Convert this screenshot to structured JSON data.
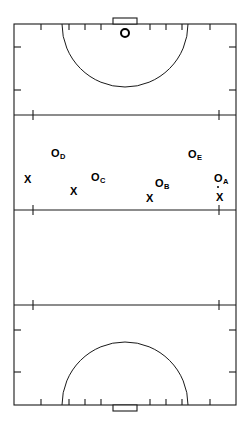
{
  "diagram": {
    "sport": "field-hockey",
    "colors": {
      "line": "#1a1a1a",
      "marker": "#000000",
      "background": "#ffffff"
    },
    "field": {
      "left": 14,
      "right": 236,
      "top": 24,
      "bottom": 405,
      "line_width": 1.1
    },
    "horizontal_lines": [
      {
        "name": "back-line-top",
        "y": 24
      },
      {
        "name": "twenty-five-yard-line-top",
        "y": 115
      },
      {
        "name": "halfway-line",
        "y": 210
      },
      {
        "name": "twenty-five-yard-line-bottom",
        "y": 305
      },
      {
        "name": "back-line-bottom",
        "y": 405
      }
    ],
    "side_tick_y": [
      47,
      90,
      115,
      210,
      305,
      330,
      372
    ],
    "top_line_ticks_x": [
      41,
      69,
      85,
      101,
      150,
      166,
      182,
      210
    ],
    "bottom_line_ticks_x": [
      41,
      69,
      85,
      101,
      150,
      166,
      182,
      210
    ],
    "shooting_circles": [
      {
        "name": "shooting-circle-top",
        "cx": 125,
        "cy": 24,
        "r": 63
      },
      {
        "name": "shooting-circle-bottom",
        "cx": 125,
        "cy": 405,
        "r": 63
      }
    ],
    "goals": [
      {
        "name": "goal-top",
        "x": 113,
        "y": 18,
        "width": 24,
        "height": 6
      },
      {
        "name": "goal-bottom",
        "x": 113,
        "y": 405,
        "width": 24,
        "height": 6
      }
    ],
    "ball": {
      "name": "ball-in-circle-top",
      "cx": 125,
      "cy": 33,
      "r": 4
    }
  },
  "markers": {
    "o_label": "O",
    "x_label": "X",
    "attackers": [
      {
        "id": "O-A",
        "letter": "O",
        "sub": "A",
        "x": 214,
        "y": 173
      },
      {
        "id": "O-B",
        "letter": "O",
        "sub": "B",
        "x": 155,
        "y": 178
      },
      {
        "id": "O-C",
        "letter": "O",
        "sub": "C",
        "x": 91,
        "y": 172
      },
      {
        "id": "O-D",
        "letter": "O",
        "sub": "D",
        "x": 51,
        "y": 148
      },
      {
        "id": "O-E",
        "letter": "O",
        "sub": "E",
        "x": 188,
        "y": 149
      }
    ],
    "defenders": [
      {
        "id": "X-1",
        "x": 24,
        "y": 174
      },
      {
        "id": "X-2",
        "x": 70,
        "y": 186
      },
      {
        "id": "X-3",
        "x": 146,
        "y": 193
      },
      {
        "id": "X-4",
        "x": 216,
        "y": 192
      }
    ],
    "ball_dots": [
      {
        "id": "ball-dot-A",
        "x": 217,
        "y": 186
      }
    ]
  }
}
